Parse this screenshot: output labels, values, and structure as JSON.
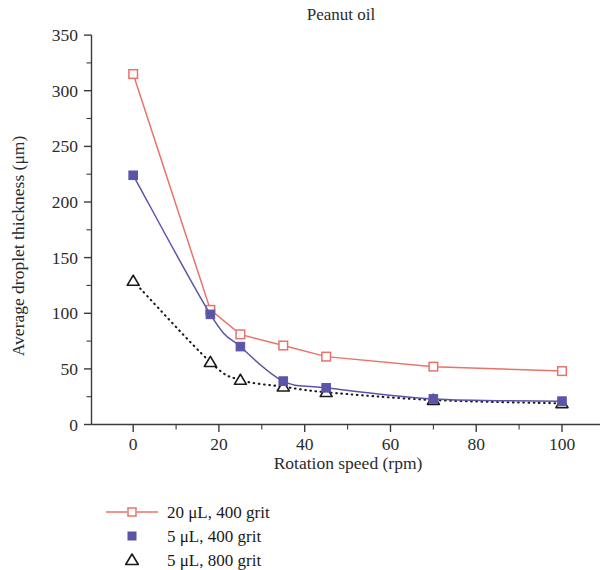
{
  "chart_data": {
    "type": "line",
    "title": "Peanut oil",
    "xlabel": "Rotation speed (rpm)",
    "ylabel": "Average droplet thickness (μm)",
    "xlim": [
      -5,
      108
    ],
    "ylim": [
      0,
      350
    ],
    "grid": false,
    "legend_position": "below-left",
    "x_ticks": [
      0,
      20,
      40,
      60,
      80,
      100
    ],
    "x_tick_labels": [
      "0",
      "20",
      "40",
      "60",
      "80",
      "100"
    ],
    "x_minor_ticks": [
      10,
      30,
      50,
      70,
      90
    ],
    "y_ticks": [
      0,
      50,
      100,
      150,
      200,
      250,
      300,
      350
    ],
    "y_tick_labels": [
      "0",
      "50",
      "100",
      "150",
      "200",
      "250",
      "300",
      "350"
    ],
    "y_minor_ticks": [
      25,
      75,
      125,
      175,
      225,
      275,
      325
    ],
    "series": [
      {
        "name": "20 μL, 400 grit",
        "color": "#e8736a",
        "marker": "open-square",
        "line": "solid",
        "x": [
          0,
          18,
          25,
          35,
          45,
          70,
          100
        ],
        "values": [
          315,
          103,
          81,
          71,
          61,
          52,
          48
        ]
      },
      {
        "name": "5 μL, 400 grit",
        "color": "#5a55a8",
        "marker": "filled-square",
        "line": "solid",
        "x": [
          0,
          18,
          25,
          35,
          45,
          70,
          100
        ],
        "values": [
          224,
          99,
          70,
          39,
          33,
          23,
          21
        ]
      },
      {
        "name": "5 μL, 800 grit",
        "color": "#1a1a1a",
        "marker": "open-triangle",
        "line": "dotted",
        "x": [
          0,
          18,
          25,
          35,
          45,
          70,
          100
        ],
        "values": [
          129,
          56,
          40,
          34,
          29,
          22,
          19
        ]
      }
    ]
  },
  "legend": {
    "items": [
      {
        "label": "20 μL, 400 grit"
      },
      {
        "label": "5 μL, 400 grit"
      },
      {
        "label": "5 μL, 800 grit"
      }
    ]
  },
  "axis_tick_text": {
    "y": [
      "350",
      "300",
      "250",
      "200",
      "150",
      "100",
      "50",
      "0"
    ],
    "x": [
      "0",
      "20",
      "40",
      "60",
      "80",
      "100"
    ]
  }
}
